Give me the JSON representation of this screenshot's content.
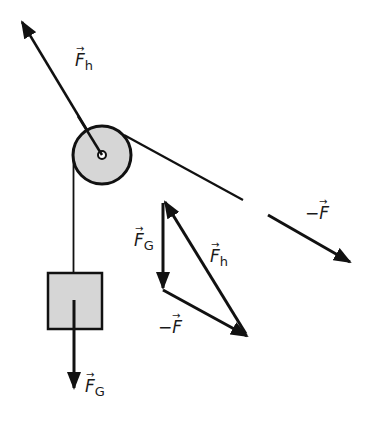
{
  "diagram": {
    "colors": {
      "stroke": "#111111",
      "fill": "#d6d6d6",
      "background": "#ffffff"
    },
    "pulley": {
      "cx": 102,
      "cy": 155,
      "r": 29
    },
    "box": {
      "x": 47,
      "y": 273,
      "w": 55,
      "h": 56
    },
    "labels": {
      "fh_top": {
        "main": "F",
        "sub": "h",
        "arrow": "→"
      },
      "neg_f_right": {
        "main": "−F",
        "sub": "",
        "arrow": "→"
      },
      "fg_triangle": {
        "main": "F",
        "sub": "G",
        "arrow": "→"
      },
      "fh_triangle": {
        "main": "F",
        "sub": "h",
        "arrow": "→"
      },
      "neg_f_triangle": {
        "main": "−F",
        "sub": "",
        "arrow": "→"
      },
      "fg_bottom": {
        "main": "F",
        "sub": "G",
        "arrow": "→"
      }
    }
  }
}
